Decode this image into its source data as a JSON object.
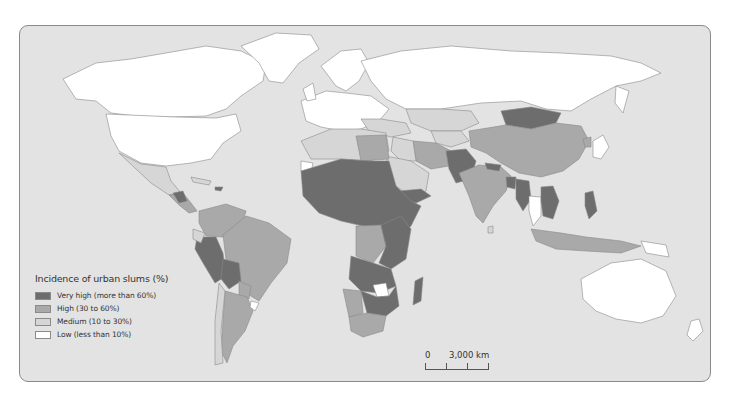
{
  "map": {
    "legend": {
      "title": "Incidence of urban slums (%)",
      "items": [
        {
          "label": "Very high (more than 60%)",
          "color": "#6d6d6d"
        },
        {
          "label": "High (30 to 60%)",
          "color": "#a9a9a9"
        },
        {
          "label": "Medium (10 to 30%)",
          "color": "#d6d6d6"
        },
        {
          "label": "Low (less than 10%)",
          "color": "#ffffff"
        }
      ]
    },
    "scale": {
      "zero": "0",
      "max": "3,000 km"
    },
    "colors": {
      "ocean": "#e3e3e3",
      "very_high": "#6d6d6d",
      "high": "#a9a9a9",
      "medium": "#d6d6d6",
      "low": "#ffffff",
      "border": "#8a8a8a"
    }
  }
}
